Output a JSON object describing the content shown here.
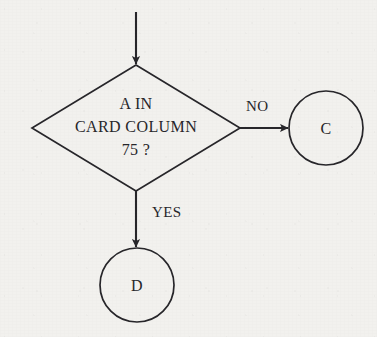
{
  "diagram": {
    "type": "flowchart",
    "background_color": "#f2f1ee",
    "stroke_color": "#27262a",
    "entry_arrow": {
      "name": "entry-arrow",
      "from_x": 136,
      "from_y": 12,
      "to_x": 136,
      "to_y": 64
    },
    "decision": {
      "name": "decision-diamond",
      "center_x": 136,
      "center_y": 128,
      "half_width": 104,
      "half_height": 63,
      "lines": [
        "A IN",
        "CARD COLUMN",
        "75 ?"
      ],
      "line1": "A IN",
      "line2": "CARD COLUMN",
      "line3": "75 ?"
    },
    "branches": [
      {
        "name": "branch-no",
        "label": "NO",
        "label_x": 246,
        "label_y": 99,
        "arrow": {
          "from_x": 240,
          "from_y": 128,
          "to_x": 288,
          "to_y": 128
        },
        "target": "C"
      },
      {
        "name": "branch-yes",
        "label": "YES",
        "label_x": 152,
        "label_y": 205,
        "arrow": {
          "from_x": 136,
          "from_y": 191,
          "to_x": 136,
          "to_y": 247
        },
        "target": "D"
      }
    ],
    "connectors": [
      {
        "name": "connector-c",
        "label": "C",
        "center_x": 326,
        "center_y": 128,
        "radius": 37
      },
      {
        "name": "connector-d",
        "label": "D",
        "center_x": 137,
        "center_y": 285,
        "radius": 37
      }
    ]
  }
}
